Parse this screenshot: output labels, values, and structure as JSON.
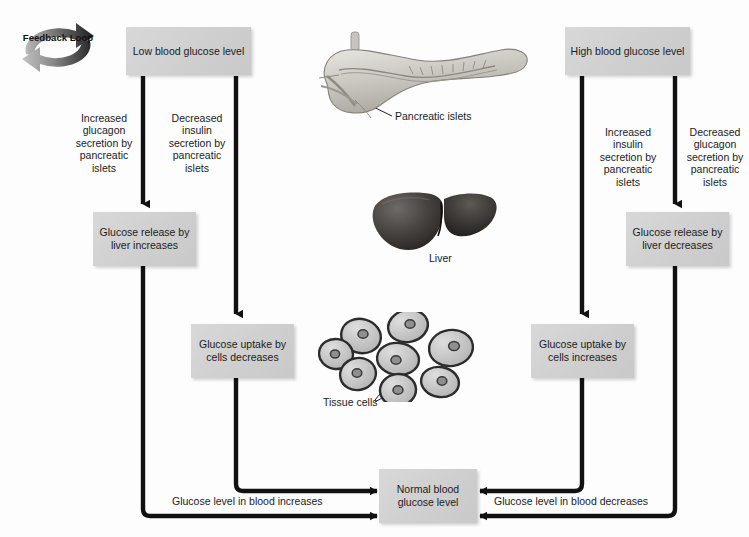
{
  "diagram": {
    "feedback_badge": "Feedback\nLoop",
    "colors": {
      "box_fill": "#d2d2d2",
      "arrow": "#111111",
      "text": "#1b1b1b",
      "background": "#fdfdfd"
    }
  },
  "boxes": {
    "low_blood_glucose": "Low blood\nglucose level",
    "high_blood_glucose": "High blood\nglucose level",
    "glucose_release_increases": "Glucose release\nby liver\nincreases",
    "glucose_uptake_decreases": "Glucose uptake\nby cells\ndecreases",
    "glucose_release_decreases": "Glucose release\nby liver\ndecreases",
    "glucose_uptake_increases": "Glucose uptake\nby cells\nincreases",
    "normal_blood_glucose": "Normal\nblood\nglucose level"
  },
  "pathway_labels": {
    "increased_glucagon": "Increased\nglucagon\nsecretion by\npancreatic\nislets",
    "decreased_insulin": "Decreased\ninsulin\nsecretion by\npancreatic\nislets",
    "increased_insulin": "Increased\ninsulin\nsecretion by\npancreatic\nislets",
    "decreased_glucagon": "Decreased\nglucagon\nsecretion by\npancreatic\nislets",
    "glucose_increases": "Glucose level in blood increases",
    "glucose_decreases": "Glucose level in blood decreases"
  },
  "organs": {
    "pancreas_label": "Pancreatic islets",
    "liver_label": "Liver",
    "tissue_label": "Tissue cells"
  }
}
